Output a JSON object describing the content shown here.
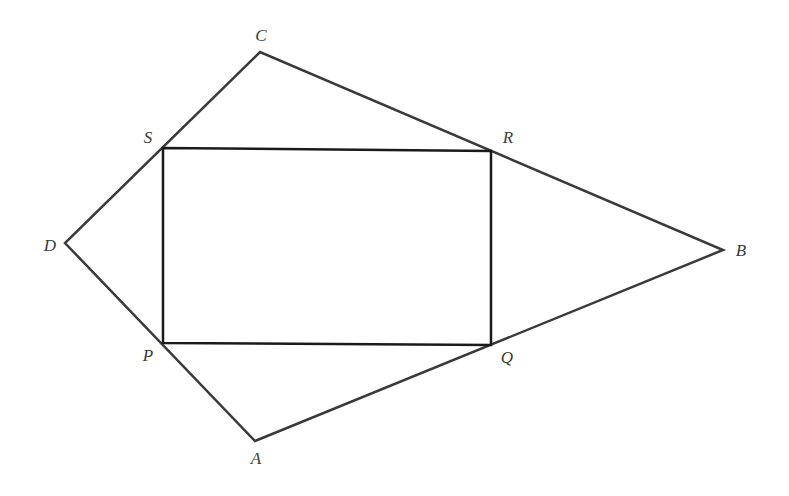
{
  "diagram": {
    "type": "geometry",
    "outer_quadrilateral": {
      "name": "ABCD",
      "stroke": "#3a3a3a",
      "vertices": {
        "A": [
          255,
          441
        ],
        "B": [
          723,
          250
        ],
        "C": [
          260,
          52
        ],
        "D": [
          65,
          243
        ]
      }
    },
    "inner_rectangle": {
      "name": "PQRS",
      "stroke": "#1a1a1a",
      "vertices": {
        "P": [
          163,
          343
        ],
        "Q": [
          491,
          345
        ],
        "R": [
          491,
          151
        ],
        "S": [
          163,
          148
        ]
      }
    },
    "labels": [
      {
        "text": "A",
        "x": 256,
        "y": 458
      },
      {
        "text": "B",
        "x": 741,
        "y": 250
      },
      {
        "text": "C",
        "x": 261,
        "y": 35
      },
      {
        "text": "D",
        "x": 50,
        "y": 245
      },
      {
        "text": "P",
        "x": 148,
        "y": 355
      },
      {
        "text": "Q",
        "x": 507,
        "y": 357
      },
      {
        "text": "R",
        "x": 508,
        "y": 137
      },
      {
        "text": "S",
        "x": 148,
        "y": 137
      }
    ]
  }
}
